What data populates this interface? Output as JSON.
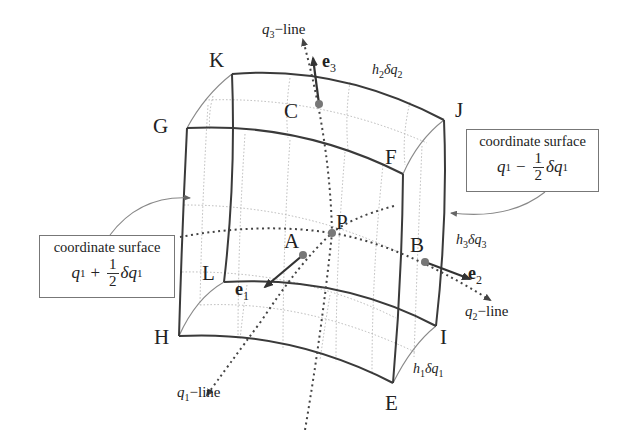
{
  "figure": {
    "vertices": {
      "K": "K",
      "G": "G",
      "J": "J",
      "F": "F",
      "L": "L",
      "H": "H",
      "I": "I",
      "E": "E"
    },
    "points": {
      "P": "P",
      "A": "A",
      "B": "B",
      "C": "C"
    },
    "unit_vectors": {
      "e1": {
        "base": "e",
        "sub": "1"
      },
      "e2": {
        "base": "e",
        "sub": "2"
      },
      "e3": {
        "base": "e",
        "sub": "3"
      }
    },
    "coordinate_lines": {
      "q1": {
        "var": "q",
        "sub": "1",
        "suffix": "−line"
      },
      "q2": {
        "var": "q",
        "sub": "2",
        "suffix": "−line"
      },
      "q3": {
        "var": "q",
        "sub": "3",
        "suffix": "−line"
      }
    },
    "edge_lengths": {
      "h1dq1": {
        "h": "h",
        "hsub": "1",
        "delta": "δ",
        "q": "q",
        "qsub": "1"
      },
      "h2dq2": {
        "h": "h",
        "hsub": "2",
        "delta": "δ",
        "q": "q",
        "qsub": "2"
      },
      "h3dq3": {
        "h": "h",
        "hsub": "3",
        "delta": "δ",
        "q": "q",
        "qsub": "3"
      }
    },
    "callouts": {
      "left": {
        "title": "coordinate surface",
        "var": "q",
        "sub": "1",
        "op": "+",
        "num": "1",
        "den": "2",
        "delta": "δ",
        "var2": "q",
        "sub2": "1"
      },
      "right": {
        "title": "coordinate surface",
        "var": "q",
        "sub": "1",
        "op": "−",
        "num": "1",
        "den": "2",
        "delta": "δ",
        "var2": "q",
        "sub2": "1"
      }
    },
    "colors": {
      "edge": "#3a3a3a",
      "hidden_edge": "#8a8a8a",
      "grid": "#aaaaaa",
      "point": "#777777",
      "callout_border": "#777777"
    }
  }
}
